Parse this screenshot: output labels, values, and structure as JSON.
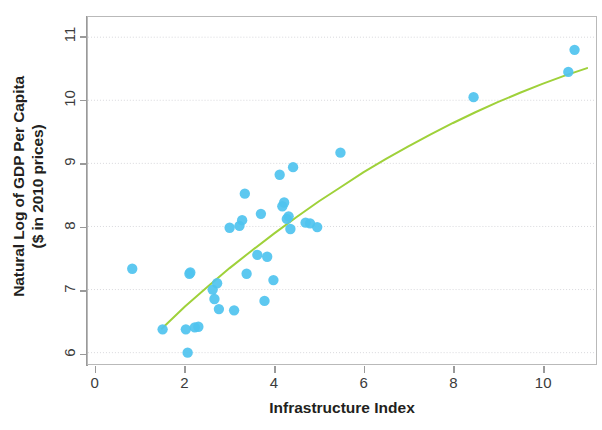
{
  "chart_data": {
    "type": "scatter",
    "title": "",
    "xlabel": "Infrastructure Index",
    "ylabel": "Natural Log of GDP Per Capita\n($ in 2010 prices)",
    "ylabel_line1": "Natural Log of GDP Per Capita",
    "ylabel_line2": "($ in 2010 prices)",
    "xlim": [
      -0.17,
      11.2
    ],
    "ylim": [
      5.82,
      11.32
    ],
    "xticks": [
      0,
      2,
      4,
      6,
      8,
      10
    ],
    "xtick_labels": [
      "0",
      "2",
      "4",
      "6",
      "8",
      "10"
    ],
    "yticks": [
      6,
      7,
      8,
      9,
      10,
      11
    ],
    "ytick_labels": [
      "6",
      "7",
      "8",
      "9",
      "10",
      "11"
    ],
    "grid": true,
    "grid_axis": "y",
    "grid_color": "#d8d8dc",
    "legend": false,
    "point_color": "#4fc3ef",
    "point_radius": 5.2,
    "trendline_color": "#9fd13a",
    "trendline_label": "fitted curve",
    "series": [
      {
        "name": "Countries",
        "points": [
          [
            0.82,
            7.33
          ],
          [
            1.5,
            6.37
          ],
          [
            2.02,
            6.37
          ],
          [
            2.06,
            6.0
          ],
          [
            2.1,
            7.25
          ],
          [
            2.12,
            7.27
          ],
          [
            2.22,
            6.4
          ],
          [
            2.3,
            6.41
          ],
          [
            2.62,
            7.0
          ],
          [
            2.66,
            6.85
          ],
          [
            2.72,
            7.1
          ],
          [
            2.76,
            6.69
          ],
          [
            3.0,
            7.98
          ],
          [
            3.1,
            6.67
          ],
          [
            3.22,
            8.01
          ],
          [
            3.28,
            8.1
          ],
          [
            3.34,
            8.52
          ],
          [
            3.38,
            7.25
          ],
          [
            3.62,
            7.55
          ],
          [
            3.7,
            8.2
          ],
          [
            3.78,
            6.82
          ],
          [
            3.84,
            7.52
          ],
          [
            3.98,
            7.15
          ],
          [
            4.12,
            8.82
          ],
          [
            4.18,
            8.32
          ],
          [
            4.22,
            8.38
          ],
          [
            4.28,
            8.12
          ],
          [
            4.32,
            8.16
          ],
          [
            4.36,
            7.96
          ],
          [
            4.42,
            8.94
          ],
          [
            4.7,
            8.06
          ],
          [
            4.8,
            8.05
          ],
          [
            4.96,
            7.99
          ],
          [
            5.48,
            9.17
          ],
          [
            8.46,
            10.05
          ],
          [
            10.58,
            10.45
          ],
          [
            10.72,
            10.8
          ]
        ]
      }
    ],
    "trendline": [
      [
        1.48,
        6.38
      ],
      [
        2.0,
        6.73
      ],
      [
        2.5,
        7.04
      ],
      [
        3.0,
        7.34
      ],
      [
        3.5,
        7.62
      ],
      [
        4.0,
        7.89
      ],
      [
        4.5,
        8.15
      ],
      [
        5.0,
        8.4
      ],
      [
        5.5,
        8.63
      ],
      [
        6.0,
        8.86
      ],
      [
        6.5,
        9.07
      ],
      [
        7.0,
        9.27
      ],
      [
        7.5,
        9.46
      ],
      [
        8.0,
        9.64
      ],
      [
        8.5,
        9.81
      ],
      [
        9.0,
        9.97
      ],
      [
        9.5,
        10.12
      ],
      [
        10.0,
        10.26
      ],
      [
        10.5,
        10.39
      ],
      [
        11.0,
        10.51
      ]
    ]
  }
}
